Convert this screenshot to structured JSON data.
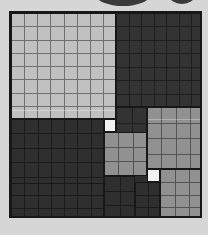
{
  "scene": {
    "title": "Grayscale quadtree block grid",
    "canvas_width": 208,
    "canvas_height": 235,
    "background_color": "#d6d6d6",
    "board": {
      "x": 9,
      "y": 11,
      "width": 193,
      "height": 207,
      "border_color": "#171717",
      "border_width": 2,
      "cell_size": 12.5,
      "grid_line_color": "#00000042"
    },
    "palette": {
      "white": "#f2f2f2",
      "light_gray": "#c0c0c0",
      "medium_gray": "#919191",
      "dark_gray": "#333333",
      "darker_gray": "#2b2b2b",
      "outline": "#171717",
      "backdrop": "#d6d6d6",
      "arc": "#3a3a3a"
    },
    "top_arcs": [
      {
        "name": "arc-left",
        "x": 96,
        "y": -16,
        "width": 54,
        "height": 22,
        "color": "#3a3a3a"
      },
      {
        "name": "arc-right",
        "x": 169,
        "y": -14,
        "width": 26,
        "height": 18,
        "color": "#3a3a3a"
      }
    ],
    "blocks": [
      {
        "name": "block-top-left-light",
        "x": 0,
        "y": 0,
        "width": 105,
        "height": 106,
        "color": "#c0c0c0",
        "cols": 8,
        "rows": 8,
        "sheen": 96
      },
      {
        "name": "block-top-right-dark",
        "x": 105,
        "y": 0,
        "width": 88,
        "height": 94,
        "color": "#333333",
        "cols": 7,
        "rows": 7,
        "sheen": -1
      },
      {
        "name": "block-upper-mid-dark",
        "x": 105,
        "y": 94,
        "width": 31,
        "height": 31,
        "color": "#333333",
        "cols": 2,
        "rows": 2,
        "sheen": -1
      },
      {
        "name": "block-right-mid-gray",
        "x": 136,
        "y": 94,
        "width": 57,
        "height": 62,
        "color": "#919191",
        "cols": 4,
        "rows": 4,
        "sheen": 11
      },
      {
        "name": "block-bottom-left-dark",
        "x": 0,
        "y": 106,
        "width": 93,
        "height": 101,
        "color": "#2f2f2f",
        "cols": 7,
        "rows": 7,
        "sheen": -1
      },
      {
        "name": "block-white-cell-upper",
        "x": 93,
        "y": 106,
        "width": 12,
        "height": 13,
        "color": "#f2f2f2",
        "cols": 1,
        "rows": 1,
        "sheen": -1
      },
      {
        "name": "block-center-gray",
        "x": 93,
        "y": 119,
        "width": 43,
        "height": 44,
        "color": "#919191",
        "cols": 3,
        "rows": 3,
        "sheen": -1
      },
      {
        "name": "block-white-cell-lower",
        "x": 136,
        "y": 156,
        "width": 13,
        "height": 13,
        "color": "#f2f2f2",
        "cols": 1,
        "rows": 1,
        "sheen": -1
      },
      {
        "name": "block-right-lower-gray",
        "x": 149,
        "y": 156,
        "width": 44,
        "height": 51,
        "color": "#919191",
        "cols": 3,
        "rows": 4,
        "sheen": -1
      },
      {
        "name": "block-bottom-mid-dark-a",
        "x": 93,
        "y": 163,
        "width": 31,
        "height": 44,
        "color": "#2f2f2f",
        "cols": 2,
        "rows": 3,
        "sheen": -1
      },
      {
        "name": "block-bottom-mid-dark-b",
        "x": 124,
        "y": 169,
        "width": 25,
        "height": 38,
        "color": "#2f2f2f",
        "cols": 2,
        "rows": 3,
        "sheen": -1
      },
      {
        "name": "block-bottom-left-strip",
        "x": 0,
        "y": 170,
        "width": 93,
        "height": 37,
        "color": "#2f2f2f",
        "cols": 7,
        "rows": 3,
        "sheen": -1
      }
    ]
  }
}
